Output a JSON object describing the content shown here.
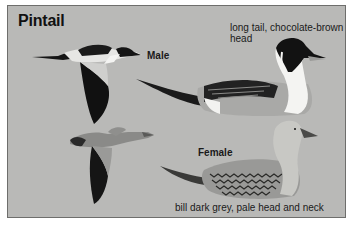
{
  "plate": {
    "title": "Pintail",
    "background_color": "#b9b9b7",
    "border_color": "#6e6e6c"
  },
  "male": {
    "label": "Male",
    "note": "long tail, chocolate-brown head",
    "illustrations": [
      "male-flying",
      "male-swimming"
    ]
  },
  "female": {
    "label": "Female",
    "note": "bill dark grey, pale head and neck",
    "illustrations": [
      "female-flying",
      "female-swimming"
    ]
  }
}
